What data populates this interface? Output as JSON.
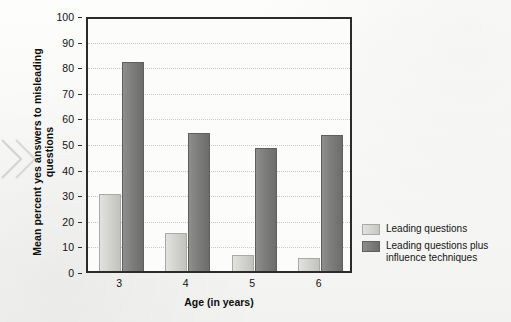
{
  "chart_data": {
    "type": "bar",
    "title": "",
    "categories": [
      "3",
      "4",
      "5",
      "6"
    ],
    "series": [
      {
        "name": "Leading questions",
        "values": [
          31,
          15.5,
          7,
          6
        ],
        "color": "#d2d2cf"
      },
      {
        "name": "Leading questions plus influence techniques",
        "values": [
          82.5,
          54.5,
          49,
          54
        ],
        "color": "#7d7d7b"
      }
    ],
    "xlabel": "Age (in years)",
    "ylabel": "Mean percent yes answers to misleading questions",
    "ylim": [
      0,
      100
    ],
    "yticks": [
      0,
      10,
      20,
      30,
      40,
      50,
      60,
      70,
      80,
      90,
      100
    ],
    "ytick_labels": [
      "0",
      "10",
      "20",
      "30",
      "40",
      "50",
      "60",
      "70",
      "80",
      "90",
      "100"
    ],
    "grid": true,
    "grid_axis": "y",
    "legend_position": "right"
  },
  "legend": {
    "entries": [
      {
        "label": "Leading questions",
        "swatch": "light-gray-swatch"
      },
      {
        "label": "Leading questions plus influence techniques",
        "swatch": "dark-gray-swatch"
      }
    ]
  },
  "decoration": {
    "chevron": "double-chevron-right-icon"
  }
}
